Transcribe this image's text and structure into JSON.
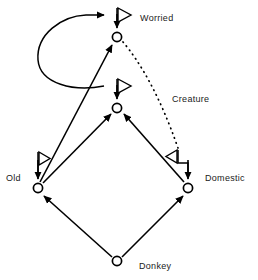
{
  "diagram": {
    "type": "directed-graph",
    "title": "",
    "background_color": "#ffffff",
    "stroke_color": "#000000",
    "label_color": "#1a1a1a",
    "nodes": [
      {
        "id": "worried",
        "label": "Worried",
        "cx": 117,
        "cy": 37,
        "r": 5,
        "label_x": 140,
        "label_y": 13,
        "has_flag": true,
        "flag_dir": "right"
      },
      {
        "id": "creature",
        "label": "Creature",
        "cx": 117,
        "cy": 108,
        "r": 5,
        "label_x": 172,
        "label_y": 94,
        "has_flag": true,
        "flag_dir": "right"
      },
      {
        "id": "old",
        "label": "Old",
        "cx": 38,
        "cy": 188,
        "r": 5,
        "label_x": 6,
        "label_y": 173,
        "has_flag": true,
        "flag_dir": "right"
      },
      {
        "id": "domestic",
        "label": "Domestic",
        "cx": 188,
        "cy": 188,
        "r": 5,
        "label_x": 205,
        "label_y": 173,
        "has_flag": true,
        "flag_dir": "left"
      },
      {
        "id": "donkey",
        "label": "Donkey",
        "cx": 117,
        "cy": 261,
        "r": 5,
        "label_x": 139,
        "label_y": 261,
        "has_flag": false,
        "flag_dir": ""
      }
    ],
    "edges": [
      {
        "id": "donkey-old",
        "from": "donkey",
        "to": "old",
        "style": "solid",
        "shape": "line"
      },
      {
        "id": "donkey-domestic",
        "from": "donkey",
        "to": "domestic",
        "style": "solid",
        "shape": "line"
      },
      {
        "id": "old-creature",
        "from": "old",
        "to": "creature",
        "style": "solid",
        "shape": "line"
      },
      {
        "id": "domestic-creature",
        "from": "domestic",
        "to": "creature",
        "style": "solid",
        "shape": "line"
      },
      {
        "id": "old-worried",
        "from": "old",
        "to": "worried",
        "style": "solid",
        "shape": "line"
      },
      {
        "id": "creature-worried",
        "from": "creature",
        "to": "worried",
        "style": "solid",
        "shape": "curve-loop-left"
      },
      {
        "id": "worried-domestic",
        "style": "dotted",
        "from": "worried",
        "to": "domestic",
        "shape": "curve-right"
      }
    ],
    "legend": {
      "node_glyph": "hollow-circle",
      "arrowhead_glyph": "solid-triangle",
      "flag_glyph": "hollow-triangle-pole"
    }
  }
}
